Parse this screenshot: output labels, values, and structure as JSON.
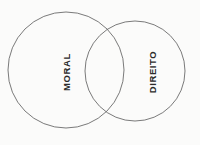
{
  "diagram": {
    "type": "venn",
    "title": "",
    "background_color": "#fbfbfa",
    "stroke_color": "#6b6b6b",
    "label_color": "#2b2b2b",
    "sets": [
      {
        "id": "moral",
        "label": "MORAL",
        "position": "left",
        "rotation_deg": -90,
        "center_x": 66,
        "center_y": 70,
        "radius": 58
      },
      {
        "id": "direito",
        "label": "DIREITO",
        "position": "right",
        "rotation_deg": -90,
        "center_x": 135,
        "center_y": 71,
        "radius": 50
      }
    ],
    "intersection": {
      "label": "",
      "shaded": false
    }
  },
  "ghost_text": {
    "description": "faint illegible bleed-through text from the reverse side of the scanned page",
    "lines": [
      "",
      "",
      "",
      "",
      "",
      "",
      "",
      "",
      ""
    ]
  }
}
